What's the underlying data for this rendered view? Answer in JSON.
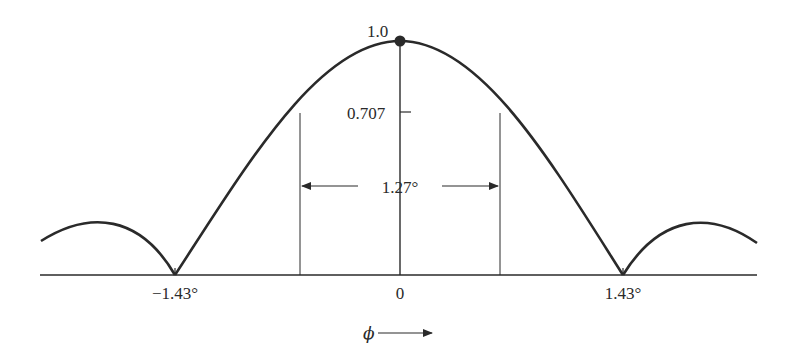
{
  "diagram": {
    "type": "antenna-radiation-pattern",
    "peak_label": "1.0",
    "half_power_label": "0.707",
    "beamwidth_label": "1.27°",
    "left_null_label": "−1.43°",
    "center_label": "0",
    "right_null_label": "1.43°",
    "axis_label": "ϕ",
    "colors": {
      "stroke": "#2a2a2a",
      "background": "#ffffff"
    }
  }
}
